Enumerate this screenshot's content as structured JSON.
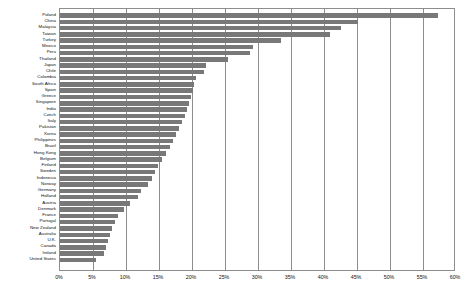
{
  "chart_data": {
    "type": "bar",
    "orientation": "horizontal",
    "title": "",
    "subtitle": "",
    "xlabel": "",
    "ylabel": "",
    "xlim": [
      0,
      60
    ],
    "ylim": null,
    "grid": true,
    "legend": null,
    "legend_position": "none",
    "value_unit": "%",
    "bar_color": "#787878",
    "axis_color": "#8d8d8d",
    "background_color": "#ffffff",
    "xticks": [
      "0%",
      "5%",
      "10%",
      "15%",
      "20%",
      "25%",
      "30%",
      "35%",
      "40%",
      "45%",
      "50%",
      "55%",
      "60%"
    ],
    "xtick_values": [
      0,
      5,
      10,
      15,
      20,
      25,
      30,
      35,
      40,
      45,
      50,
      55,
      60
    ],
    "categories": [
      "Poland",
      "China",
      "Malaysia",
      "Taiwan",
      "Turkey",
      "Mexico",
      "Peru",
      "Thailand",
      "Japan",
      "Chile",
      "Colombia",
      "South Africa",
      "Spain",
      "Greece",
      "Singapore",
      "India",
      "Czech",
      "Italy",
      "Pakistan",
      "Korea",
      "Philippines",
      "Brazil",
      "Hong Kong",
      "Belgium",
      "Finland",
      "Sweden",
      "Indonesia",
      "Norway",
      "Germany",
      "Holland",
      "Austria",
      "Denmark",
      "France",
      "Portugal",
      "New Zealand",
      "Australia",
      "U.K.",
      "Canada",
      "Ireland",
      "United States"
    ],
    "values": [
      57.2,
      45.2,
      42.6,
      40.9,
      33.5,
      29.2,
      28.8,
      25.4,
      22.1,
      21.8,
      20.6,
      20.3,
      20.1,
      19.8,
      19.6,
      19.3,
      18.9,
      18.5,
      18.0,
      17.6,
      17.1,
      16.6,
      16.0,
      15.4,
      14.9,
      14.4,
      13.9,
      13.3,
      12.3,
      11.8,
      10.6,
      9.7,
      8.8,
      8.3,
      7.9,
      7.6,
      7.3,
      7.0,
      6.6,
      5.4
    ]
  }
}
